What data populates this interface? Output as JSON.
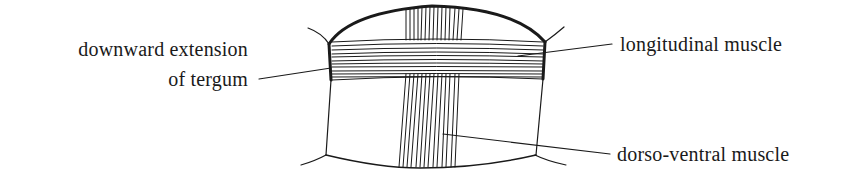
{
  "diagram": {
    "labels": {
      "tergum_line1": "downward extension",
      "tergum_line2": "of tergum",
      "longitudinal": "longitudinal muscle",
      "dorso_ventral": "dorso-ventral muscle"
    },
    "colors": {
      "ink": "#1a1a1a",
      "background": "#ffffff"
    }
  }
}
